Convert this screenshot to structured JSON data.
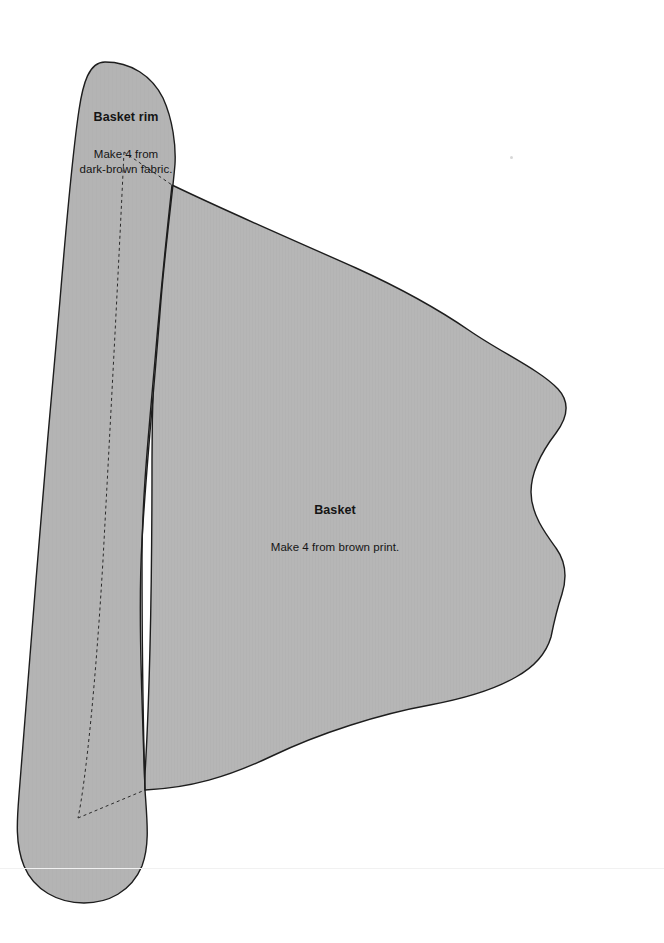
{
  "sheet": {
    "title": "Quilt applique pattern sheet",
    "width": 664,
    "height": 943,
    "background_color": "#ffffff"
  },
  "style": {
    "piece_fill": "#b6b6b6",
    "piece_fill_alt": "#b2b2b2",
    "outline_color": "#1d1d1d",
    "outline_width": 1.4,
    "dashed_color": "#2a2a2a",
    "dashed_width": 1.0,
    "dash_pattern": "3 3",
    "text_color": "#151515",
    "speck_color": "#c9c9c9",
    "scan_line_color": "#f1f1f1"
  },
  "pieces": [
    {
      "id": "basket-rim",
      "name": "Basket rim",
      "title": "Basket rim",
      "note": "Make 4 from\ndark-brown fabric.",
      "quantity": 4,
      "fabric": "dark-brown fabric",
      "label_x": 46,
      "label_y": 89
    },
    {
      "id": "basket",
      "name": "Basket",
      "title": "Basket",
      "note": "Make 4 from brown print.",
      "quantity": 4,
      "fabric": "brown print",
      "label_x": 255,
      "label_y": 482
    }
  ],
  "artifacts": {
    "speck": {
      "x": 510,
      "y": 156
    },
    "scan_line_y": 868
  },
  "shapes": {
    "basket_path": "M 172 185 C 230 213 300 243 356 268 C 400 288 438 309 470 331 C 502 353 540 370 558 389 C 570 402 568 417 556 433 C 543 450 531 470 531 492 C 531 514 545 533 556 548 C 566 562 567 578 562 594 C 556 612 554 622 551 637 C 546 654 534 667 516 677 C 492 691 462 699 430 705 C 380 714 320 733 272 756 C 228 777 190 788 145 790 L 144 790 C 150 700 152 560 152 460 C 152 350 160 250 172 185 Z",
    "rim_path": "M 105 62 C 131 62 152 76 163 98 C 173 120 176 146 175 164 C 173 190 166 240 161 300 C 154 390 146 470 142 540 C 138 610 142 700 145 790 C 147 820 150 845 142 866 C 131 892 108 903 84 903 C 58 903 34 890 24 866 C 15 844 17 820 19 795 C 24 740 30 660 36 580 C 43 490 52 390 60 300 C 67 215 73 150 79 110 C 83 83 89 62 105 62 Z",
    "seam_path": "M 124 152 L 172 185 M 124 152 C 118 280 110 430 103 560 C 96 680 86 780 78 818 M 78 818 L 145 790",
    "rim_right_edge": "M 172 185 C 166 240 160 300 155 360 C 148 440 142 500 142 560 C 142 640 143 720 145 790"
  }
}
